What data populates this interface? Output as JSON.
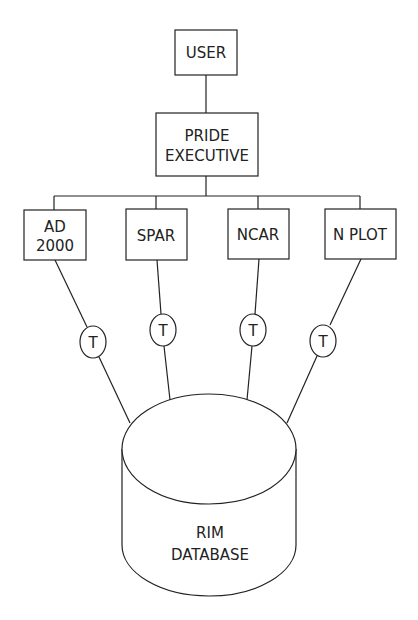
{
  "diagram": {
    "user": {
      "label": "USER"
    },
    "executive": {
      "line1": "PRIDE",
      "line2": "EXECUTIVE"
    },
    "modules": [
      {
        "line1": "AD",
        "line2": "2000"
      },
      {
        "label": "SPAR"
      },
      {
        "label": "NCAR"
      },
      {
        "label": "N PLOT"
      }
    ],
    "translators": [
      {
        "label": "T"
      },
      {
        "label": "T"
      },
      {
        "label": "T"
      },
      {
        "label": "T"
      }
    ],
    "database": {
      "line1": "RIM",
      "line2": "DATABASE"
    }
  }
}
